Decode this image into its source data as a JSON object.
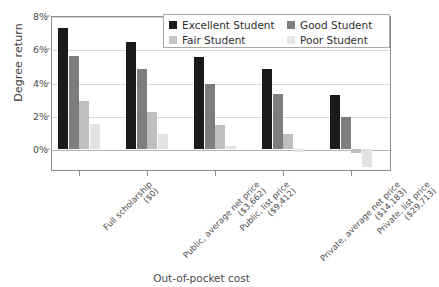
{
  "chart_data": {
    "type": "bar",
    "title": "",
    "xlabel": "Out-of-pocket cost",
    "ylabel": "Degree return",
    "ylim": [
      -1.3,
      8
    ],
    "ytick_labels": [
      "8%",
      "6%",
      "4%",
      "2%",
      "0%"
    ],
    "ytick_values": [
      8,
      6,
      4,
      2,
      0
    ],
    "grid": true,
    "legend_position": "top-right-inside",
    "categories": [
      "Full scholarship ($0)",
      "Public, average net price ($3,662)",
      "Public, list price ($9,412)",
      "Private, average net price ($14,183)",
      "Private, list price ($29,713)"
    ],
    "category_lines": [
      [
        "Full scholarship",
        "($0)"
      ],
      [
        "Public, average net price",
        "($3,662)"
      ],
      [
        "Public, list price",
        "($9,412)"
      ],
      [
        "Private, average net price",
        "($14,183)"
      ],
      [
        "Private, list price",
        "($29,713)"
      ]
    ],
    "series": [
      {
        "name": "Excellent Student",
        "color": "#1a1a1a",
        "values": [
          7.3,
          6.45,
          5.55,
          4.85,
          3.25
        ]
      },
      {
        "name": "Good Student",
        "color": "#7d7d7d",
        "values": [
          5.6,
          4.85,
          3.95,
          3.35,
          1.95
        ]
      },
      {
        "name": "Fair Student",
        "color": "#bfbfbf",
        "values": [
          2.9,
          2.25,
          1.45,
          0.95,
          -0.2
        ]
      },
      {
        "name": "Poor Student",
        "color": "#e3e3e3",
        "values": [
          1.55,
          0.95,
          0.2,
          -0.15,
          -1.05
        ]
      }
    ]
  },
  "axis": {
    "y_title": "Degree return",
    "x_title": "Out-of-pocket cost"
  },
  "legend": {
    "items": [
      {
        "label": "Excellent Student",
        "swatch": "excellent"
      },
      {
        "label": "Good Student",
        "swatch": "good"
      },
      {
        "label": "Fair Student",
        "swatch": "fair"
      },
      {
        "label": "Poor Student",
        "swatch": "poor"
      }
    ]
  }
}
